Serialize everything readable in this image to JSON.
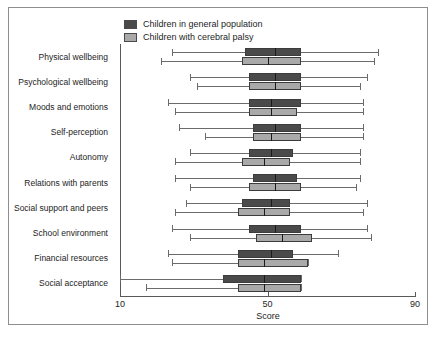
{
  "chart_data": {
    "type": "box",
    "title": "",
    "xlabel": "Score",
    "ylabel": "",
    "xlim": [
      10,
      90
    ],
    "xticks": [
      10,
      50,
      90
    ],
    "xtick_labels": [
      "10",
      "50",
      "90"
    ],
    "grid": false,
    "legend_position": "top-center",
    "legend": [
      {
        "name": "Children in general population",
        "color": "#4a4a4a"
      },
      {
        "name": "Children with cerebral palsy",
        "color": "#a9a9a9"
      }
    ],
    "categories": [
      "Physical wellbeing",
      "Psychological wellbeing",
      "Moods and emotions",
      "Self-perception",
      "Autonomy",
      "Relations with parents",
      "Social support and peers",
      "School environment",
      "Financial resources",
      "Social acceptance"
    ],
    "series": [
      {
        "name": "Children in general population",
        "color": "#4a4a4a",
        "boxes": [
          {
            "category": "Physical wellbeing",
            "whisker_low": 24.0,
            "q1": 44.0,
            "median": 52.0,
            "q3": 59.0,
            "whisker_high": 80.0
          },
          {
            "category": "Psychological wellbeing",
            "whisker_low": 29.0,
            "q1": 45.0,
            "median": 52.0,
            "q3": 59.0,
            "whisker_high": 77.0
          },
          {
            "category": "Moods and emotions",
            "whisker_low": 23.0,
            "q1": 45.0,
            "median": 51.0,
            "q3": 59.0,
            "whisker_high": 76.0
          },
          {
            "category": "Self-perception",
            "whisker_low": 26.0,
            "q1": 46.0,
            "median": 52.0,
            "q3": 59.0,
            "whisker_high": 76.0
          },
          {
            "category": "Autonomy",
            "whisker_low": 29.0,
            "q1": 45.0,
            "median": 51.0,
            "q3": 57.0,
            "whisker_high": 75.0
          },
          {
            "category": "Relations with parents",
            "whisker_low": 25.0,
            "q1": 46.0,
            "median": 52.0,
            "q3": 58.0,
            "whisker_high": 75.0
          },
          {
            "category": "Social support and peers",
            "whisker_low": 28.0,
            "q1": 43.0,
            "median": 51.0,
            "q3": 56.0,
            "whisker_high": 77.0
          },
          {
            "category": "School environment",
            "whisker_low": 24.0,
            "q1": 45.0,
            "median": 52.0,
            "q3": 59.0,
            "whisker_high": 77.0
          },
          {
            "category": "Financial resources",
            "whisker_low": 23.0,
            "q1": 42.0,
            "median": 51.0,
            "q3": 57.0,
            "whisker_high": 69.0
          },
          {
            "category": "Social acceptance",
            "whisker_low": 10.0,
            "q1": 38.0,
            "median": 49.0,
            "q3": 59.0,
            "whisker_high": 59.0
          }
        ]
      },
      {
        "name": "Children with cerebral palsy",
        "color": "#a9a9a9",
        "boxes": [
          {
            "category": "Physical wellbeing",
            "whisker_low": 21.0,
            "q1": 43.0,
            "median": 50.0,
            "q3": 59.0,
            "whisker_high": 79.0
          },
          {
            "category": "Psychological wellbeing",
            "whisker_low": 31.0,
            "q1": 45.0,
            "median": 52.0,
            "q3": 59.0,
            "whisker_high": 75.0
          },
          {
            "category": "Moods and emotions",
            "whisker_low": 25.0,
            "q1": 45.0,
            "median": 51.0,
            "q3": 58.0,
            "whisker_high": 76.0
          },
          {
            "category": "Self-perception",
            "whisker_low": 33.0,
            "q1": 46.0,
            "median": 51.0,
            "q3": 59.0,
            "whisker_high": 76.0
          },
          {
            "category": "Autonomy",
            "whisker_low": 25.0,
            "q1": 43.0,
            "median": 49.0,
            "q3": 56.0,
            "whisker_high": 75.0
          },
          {
            "category": "Relations with parents",
            "whisker_low": 29.0,
            "q1": 45.0,
            "median": 52.0,
            "q3": 59.0,
            "whisker_high": 74.0
          },
          {
            "category": "Social support and peers",
            "whisker_low": 25.0,
            "q1": 42.0,
            "median": 49.0,
            "q3": 56.0,
            "whisker_high": 76.0
          },
          {
            "category": "School environment",
            "whisker_low": 29.0,
            "q1": 47.0,
            "median": 54.0,
            "q3": 62.0,
            "whisker_high": 78.0
          },
          {
            "category": "Financial resources",
            "whisker_low": 24.0,
            "q1": 42.0,
            "median": 49.0,
            "q3": 61.0,
            "whisker_high": 61.0
          },
          {
            "category": "Social acceptance",
            "whisker_low": 17.0,
            "q1": 42.0,
            "median": 49.0,
            "q3": 59.0,
            "whisker_high": 59.0
          }
        ]
      }
    ]
  },
  "axis": {
    "x_title": "Score",
    "tick_10": "10",
    "tick_50": "50",
    "tick_90": "90"
  },
  "legend": {
    "item_0": "Children in general population",
    "item_1": "Children with cerebral palsy"
  }
}
